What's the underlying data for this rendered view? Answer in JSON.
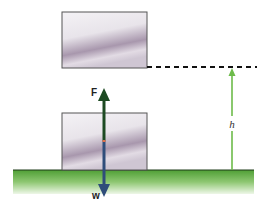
{
  "labels": {
    "force": "F",
    "weight": "w",
    "height": "h"
  },
  "colors": {
    "ground": "#5fae3c",
    "ground_light": "#e8f4df",
    "box_outline": "#444444",
    "force_arrow": "#1d4a22",
    "weight_arrow": "#2f4d7a",
    "height_arrow": "#6dbb4a",
    "dashed_line": "#111111",
    "midpoint_marker": "#e0704a"
  },
  "elements": {
    "box_top": {
      "x": 62,
      "y": 12,
      "w": 85,
      "h": 56
    },
    "box_bottom": {
      "x": 62,
      "y": 113,
      "w": 85,
      "h": 57
    },
    "ground": {
      "x": 13,
      "y": 170,
      "w": 241,
      "h": 24
    }
  }
}
